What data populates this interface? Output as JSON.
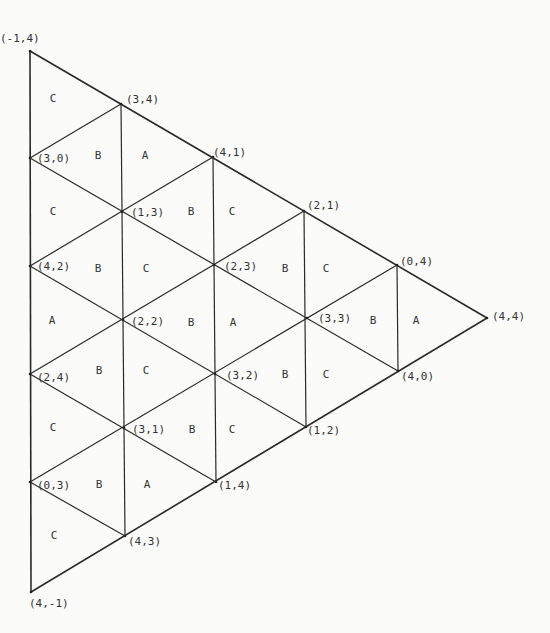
{
  "diagram": {
    "type": "triangular-grid-labelling",
    "colors": {
      "line": "#2a2a2a",
      "text": "#333333",
      "background": "#fbfbfa"
    },
    "vertices": [
      {
        "id": "v0",
        "label": "(-1,4)",
        "x": 30,
        "y": 51,
        "lx": 0,
        "ly": 42
      },
      {
        "id": "v1",
        "label": "(3,0)",
        "x": 30,
        "y": 158,
        "lx": 37,
        "ly": 162
      },
      {
        "id": "v2",
        "label": "(4,2)",
        "x": 30,
        "y": 266,
        "lx": 37,
        "ly": 270
      },
      {
        "id": "v3",
        "label": "(2,4)",
        "x": 30,
        "y": 374,
        "lx": 37,
        "ly": 381
      },
      {
        "id": "v4",
        "label": "(0,3)",
        "x": 30,
        "y": 482,
        "lx": 37,
        "ly": 489
      },
      {
        "id": "v5",
        "label": "(4,-1)",
        "x": 31,
        "y": 592,
        "lx": 29,
        "ly": 607
      },
      {
        "id": "v6",
        "label": "(3,4)",
        "x": 121,
        "y": 104,
        "lx": 126,
        "ly": 103
      },
      {
        "id": "v7",
        "label": "(1,3)",
        "x": 122,
        "y": 212,
        "lx": 131,
        "ly": 216
      },
      {
        "id": "v8",
        "label": "(2,2)",
        "x": 123,
        "y": 320,
        "lx": 131,
        "ly": 325
      },
      {
        "id": "v9",
        "label": "(3,1)",
        "x": 124,
        "y": 428,
        "lx": 132,
        "ly": 433
      },
      {
        "id": "v10",
        "label": "(4,3)",
        "x": 125,
        "y": 536,
        "lx": 128,
        "ly": 545
      },
      {
        "id": "v11",
        "label": "(4,1)",
        "x": 213,
        "y": 157,
        "lx": 213,
        "ly": 156
      },
      {
        "id": "v12",
        "label": "(2,3)",
        "x": 214,
        "y": 265,
        "lx": 224,
        "ly": 270
      },
      {
        "id": "v13",
        "label": "(3,2)",
        "x": 215,
        "y": 374,
        "lx": 226,
        "ly": 379
      },
      {
        "id": "v14",
        "label": "(1,4)",
        "x": 216,
        "y": 482,
        "lx": 218,
        "ly": 489
      },
      {
        "id": "v15",
        "label": "(2,1)",
        "x": 304,
        "y": 211,
        "lx": 307,
        "ly": 209
      },
      {
        "id": "v16",
        "label": "(3,3)",
        "x": 307,
        "y": 318,
        "lx": 318,
        "ly": 322
      },
      {
        "id": "v17",
        "label": "(1,2)",
        "x": 306,
        "y": 427,
        "lx": 307,
        "ly": 434
      },
      {
        "id": "v18",
        "label": "(0,4)",
        "x": 397,
        "y": 265,
        "lx": 400,
        "ly": 265
      },
      {
        "id": "v19",
        "label": "(4,0)",
        "x": 398,
        "y": 371,
        "lx": 401,
        "ly": 380
      },
      {
        "id": "v20",
        "label": "(4,4)",
        "x": 487,
        "y": 318,
        "lx": 492,
        "ly": 320
      }
    ],
    "edges": [
      {
        "x1": 30,
        "y1": 51,
        "x2": 31,
        "y2": 592,
        "outer": true
      },
      {
        "x1": 30,
        "y1": 51,
        "x2": 487,
        "y2": 318,
        "outer": true
      },
      {
        "x1": 31,
        "y1": 592,
        "x2": 487,
        "y2": 318,
        "outer": true
      },
      {
        "x1": 121,
        "y1": 104,
        "x2": 125,
        "y2": 536
      },
      {
        "x1": 213,
        "y1": 157,
        "x2": 216,
        "y2": 482
      },
      {
        "x1": 304,
        "y1": 211,
        "x2": 306,
        "y2": 427
      },
      {
        "x1": 397,
        "y1": 265,
        "x2": 398,
        "y2": 371
      },
      {
        "x1": 30,
        "y1": 158,
        "x2": 398,
        "y2": 371
      },
      {
        "x1": 30,
        "y1": 266,
        "x2": 306,
        "y2": 427
      },
      {
        "x1": 30,
        "y1": 374,
        "x2": 216,
        "y2": 482
      },
      {
        "x1": 30,
        "y1": 482,
        "x2": 125,
        "y2": 536
      },
      {
        "x1": 30,
        "y1": 482,
        "x2": 397,
        "y2": 265
      },
      {
        "x1": 30,
        "y1": 374,
        "x2": 304,
        "y2": 211
      },
      {
        "x1": 30,
        "y1": 266,
        "x2": 213,
        "y2": 157
      },
      {
        "x1": 30,
        "y1": 158,
        "x2": 121,
        "y2": 104
      }
    ],
    "regions": [
      {
        "label": "C",
        "x": 53,
        "y": 102
      },
      {
        "label": "B",
        "x": 98,
        "y": 159
      },
      {
        "label": "A",
        "x": 145,
        "y": 159
      },
      {
        "label": "C",
        "x": 53,
        "y": 215
      },
      {
        "label": "B",
        "x": 191,
        "y": 215
      },
      {
        "label": "C",
        "x": 232,
        "y": 215
      },
      {
        "label": "B",
        "x": 98,
        "y": 272
      },
      {
        "label": "C",
        "x": 146,
        "y": 272
      },
      {
        "label": "B",
        "x": 285,
        "y": 272
      },
      {
        "label": "C",
        "x": 326,
        "y": 272
      },
      {
        "label": "A",
        "x": 52,
        "y": 324
      },
      {
        "label": "B",
        "x": 191,
        "y": 326
      },
      {
        "label": "A",
        "x": 233,
        "y": 326
      },
      {
        "label": "B",
        "x": 373,
        "y": 324
      },
      {
        "label": "A",
        "x": 416,
        "y": 324
      },
      {
        "label": "B",
        "x": 99,
        "y": 374
      },
      {
        "label": "C",
        "x": 146,
        "y": 374
      },
      {
        "label": "B",
        "x": 285,
        "y": 378
      },
      {
        "label": "C",
        "x": 326,
        "y": 378
      },
      {
        "label": "C",
        "x": 53,
        "y": 431
      },
      {
        "label": "B",
        "x": 192,
        "y": 433
      },
      {
        "label": "C",
        "x": 232,
        "y": 433
      },
      {
        "label": "B",
        "x": 99,
        "y": 488
      },
      {
        "label": "A",
        "x": 147,
        "y": 488
      },
      {
        "label": "C",
        "x": 54,
        "y": 539
      }
    ]
  }
}
